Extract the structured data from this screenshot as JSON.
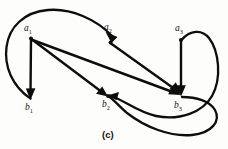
{
  "figure": {
    "caption": "(c)",
    "type": "directed-bipartite-graph",
    "stroke_color": "#0d0d0d",
    "background_color": "#fdfdfb"
  },
  "nodes": [
    {
      "id": "a1",
      "label": "a",
      "sub": "1",
      "x": 31,
      "y": 38,
      "label_x": 24,
      "label_y": 27,
      "row": "top"
    },
    {
      "id": "a2",
      "label": "a",
      "sub": "2",
      "x": 110,
      "y": 42,
      "label_x": 104,
      "label_y": 26,
      "row": "top"
    },
    {
      "id": "a3",
      "label": "a",
      "sub": "3",
      "x": 181,
      "y": 40,
      "label_x": 175,
      "label_y": 27,
      "row": "top"
    },
    {
      "id": "b1",
      "label": "b",
      "sub": "1",
      "x": 31,
      "y": 99,
      "label_x": 25,
      "label_y": 104,
      "row": "bottom"
    },
    {
      "id": "b2",
      "label": "b",
      "sub": "2",
      "x": 108,
      "y": 96,
      "label_x": 102,
      "label_y": 102,
      "row": "bottom"
    },
    {
      "id": "b3",
      "label": "b",
      "sub": "3",
      "x": 181,
      "y": 96,
      "label_x": 174,
      "label_y": 103,
      "row": "bottom"
    }
  ],
  "edges": [
    {
      "id": "e1",
      "from": "a1",
      "to": "b1",
      "shape": "straight",
      "arrow_at": "b1"
    },
    {
      "id": "e2",
      "from": "a1",
      "to": "b2",
      "shape": "straight",
      "arrow_at": "b2"
    },
    {
      "id": "e3",
      "from": "a1",
      "to": "b3",
      "shape": "straight",
      "arrow_at": "b3"
    },
    {
      "id": "e4",
      "from": "a2",
      "to": "b3",
      "shape": "straight",
      "arrow_at": "b3"
    },
    {
      "id": "e5",
      "from": "a3",
      "to": "b3",
      "shape": "straight",
      "arrow_at": "b3"
    },
    {
      "id": "e6",
      "from": "b1",
      "to": "a2",
      "shape": "curve-over-top-left",
      "arrow_at": "a2"
    },
    {
      "id": "e7",
      "from": "a3",
      "to": "b2",
      "shape": "curve-around-right-inner",
      "arrow_at": "b2"
    },
    {
      "id": "e8",
      "from": "b3",
      "to": "b2",
      "shape": "curve-around-right-outer",
      "arrow_at": "b2"
    }
  ]
}
